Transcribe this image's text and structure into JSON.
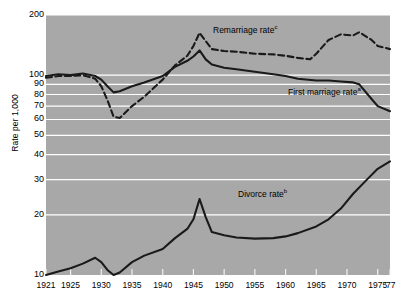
{
  "chart_data": {
    "type": "line",
    "title": "",
    "xlabel": "",
    "ylabel": "Rate per 1,000",
    "y_scale": "log",
    "ylim": [
      10,
      200
    ],
    "xlim": [
      1921,
      1977
    ],
    "grid": true,
    "legend": "inline-annotations",
    "y_ticks": [
      {
        "value": 200,
        "label": "200"
      },
      {
        "value": 100,
        "label": "100"
      },
      {
        "value": 90,
        "label": "90"
      },
      {
        "value": 80,
        "label": "80"
      },
      {
        "value": 70,
        "label": "70"
      },
      {
        "value": 60,
        "label": "60"
      },
      {
        "value": 50,
        "label": "50"
      },
      {
        "value": 40,
        "label": "40"
      },
      {
        "value": 30,
        "label": "30"
      },
      {
        "value": 20,
        "label": "20"
      },
      {
        "value": 10,
        "label": "10"
      }
    ],
    "x_ticks": [
      {
        "value": 1921,
        "label": "1921"
      },
      {
        "value": 1925,
        "label": "1925"
      },
      {
        "value": 1930,
        "label": "1930"
      },
      {
        "value": 1935,
        "label": "1935"
      },
      {
        "value": 1940,
        "label": "1940"
      },
      {
        "value": 1945,
        "label": "1945"
      },
      {
        "value": 1950,
        "label": "1950"
      },
      {
        "value": 1955,
        "label": "1955"
      },
      {
        "value": 1960,
        "label": "1960"
      },
      {
        "value": 1965,
        "label": "1965"
      },
      {
        "value": 1970,
        "label": "1970"
      },
      {
        "value": 1975,
        "label": "1975"
      },
      {
        "value": 1977,
        "label": "'77"
      }
    ],
    "series": [
      {
        "name": "Remarriage rate",
        "label": "Remarriage rate",
        "footnote": "c",
        "style": "dashed",
        "color": "#000000",
        "x": [
          1921,
          1923,
          1925,
          1927,
          1929,
          1930,
          1931,
          1932,
          1933,
          1935,
          1937,
          1940,
          1942,
          1944,
          1945,
          1946,
          1947,
          1948,
          1950,
          1952,
          1955,
          1958,
          1960,
          1962,
          1964,
          1965,
          1967,
          1969,
          1971,
          1972,
          1974,
          1975,
          1977
        ],
        "y": [
          97,
          99,
          99,
          100,
          96,
          88,
          75,
          62,
          61,
          70,
          78,
          95,
          112,
          125,
          140,
          163,
          148,
          135,
          132,
          131,
          128,
          127,
          125,
          122,
          120,
          128,
          150,
          160,
          158,
          164,
          150,
          140,
          135
        ]
      },
      {
        "name": "First marriage rate",
        "label": "First marriage rate",
        "footnote": "a",
        "style": "solid",
        "color": "#000000",
        "x": [
          1921,
          1923,
          1925,
          1927,
          1929,
          1930,
          1931,
          1932,
          1933,
          1935,
          1937,
          1940,
          1942,
          1944,
          1945,
          1946,
          1947,
          1948,
          1950,
          1952,
          1955,
          1958,
          1960,
          1962,
          1965,
          1967,
          1969,
          1971,
          1972,
          1974,
          1975,
          1977
        ],
        "y": [
          99,
          101,
          100,
          102,
          99,
          95,
          88,
          82,
          83,
          88,
          92,
          99,
          110,
          118,
          124,
          133,
          120,
          113,
          109,
          107,
          104,
          101,
          99,
          96,
          94,
          94,
          93,
          92,
          90,
          76,
          70,
          66
        ]
      },
      {
        "name": "Divorce rate",
        "label": "Divorce rate",
        "footnote": "b",
        "style": "solid",
        "color": "#000000",
        "x": [
          1921,
          1923,
          1925,
          1927,
          1929,
          1930,
          1931,
          1932,
          1933,
          1935,
          1937,
          1940,
          1942,
          1944,
          1945,
          1946,
          1947,
          1948,
          1950,
          1952,
          1955,
          1958,
          1960,
          1962,
          1965,
          1967,
          1969,
          1971,
          1973,
          1975,
          1977
        ],
        "y": [
          10.0,
          10.4,
          10.8,
          11.4,
          12.2,
          11.6,
          10.6,
          10.0,
          10.3,
          11.6,
          12.5,
          13.5,
          15.3,
          17.0,
          19.0,
          24.0,
          19.5,
          16.4,
          15.8,
          15.4,
          15.2,
          15.3,
          15.6,
          16.2,
          17.5,
          19.0,
          21.5,
          25.5,
          29.5,
          34.0,
          37.0
        ]
      }
    ]
  },
  "plot": {
    "background_color": "#a8a8a8",
    "gridline_color": "#ffffff",
    "line_color": "#1a1a1a"
  }
}
